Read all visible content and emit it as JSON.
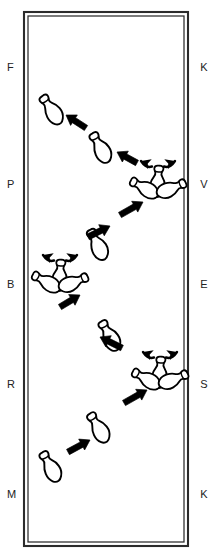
{
  "diagram": {
    "type": "pin-deflection-schematic",
    "frame": {
      "name": "lane-frame",
      "style": "double-line-rectangle",
      "color": "#2b2b2b",
      "x": 24,
      "y": 12,
      "width": 164,
      "height": 534
    },
    "colors": {
      "ink": "#000000",
      "frame": "#2b2b2b",
      "label": "#222222",
      "background": "#ffffff"
    },
    "left_labels": [
      {
        "text": "F",
        "y": 68
      },
      {
        "text": "P",
        "y": 185
      },
      {
        "text": "B",
        "y": 285
      },
      {
        "text": "R",
        "y": 385
      },
      {
        "text": "M",
        "y": 495
      }
    ],
    "right_labels": [
      {
        "text": "K",
        "y": 68
      },
      {
        "text": "V",
        "y": 185
      },
      {
        "text": "E",
        "y": 285
      },
      {
        "text": "S",
        "y": 385
      },
      {
        "text": "K",
        "y": 495
      }
    ],
    "pins": [
      {
        "name": "pin-1",
        "cx": 52,
        "cy": 110,
        "angle": -35,
        "scale": 1.0
      },
      {
        "name": "pin-2",
        "cx": 101,
        "cy": 148,
        "angle": -30,
        "scale": 1.0
      },
      {
        "name": "pin-3",
        "cx": 98,
        "cy": 245,
        "angle": -28,
        "scale": 1.0
      },
      {
        "name": "pin-4",
        "cx": 110,
        "cy": 336,
        "angle": -30,
        "scale": 1.0
      },
      {
        "name": "pin-5",
        "cx": 99,
        "cy": 428,
        "angle": -32,
        "scale": 1.0
      },
      {
        "name": "pin-6",
        "cx": 51,
        "cy": 467,
        "angle": -30,
        "scale": 1.0
      }
    ],
    "clusters": [
      {
        "name": "cluster-1",
        "cx": 158,
        "cy": 178,
        "note": "three-pin spread"
      },
      {
        "name": "cluster-2",
        "cx": 60,
        "cy": 272,
        "note": "three-pin spread"
      },
      {
        "name": "cluster-3",
        "cx": 160,
        "cy": 369,
        "note": "three-pin spread"
      }
    ],
    "arrows": [
      {
        "name": "arrow-1",
        "x1": 86,
        "y1": 128,
        "x2": 66,
        "y2": 115,
        "dir": "up-left"
      },
      {
        "name": "arrow-2",
        "x1": 137,
        "y1": 163,
        "x2": 117,
        "y2": 152,
        "dir": "up-left"
      },
      {
        "name": "arrow-3",
        "x1": 120,
        "y1": 215,
        "x2": 143,
        "y2": 202,
        "dir": "up-right"
      },
      {
        "name": "arrow-4",
        "x1": 88,
        "y1": 237,
        "x2": 110,
        "y2": 226,
        "dir": "up-right"
      },
      {
        "name": "arrow-5",
        "x1": 60,
        "y1": 307,
        "x2": 80,
        "y2": 295,
        "dir": "up-right"
      },
      {
        "name": "arrow-6",
        "x1": 122,
        "y1": 348,
        "x2": 100,
        "y2": 337,
        "dir": "down-left"
      },
      {
        "name": "arrow-7",
        "x1": 124,
        "y1": 403,
        "x2": 147,
        "y2": 390,
        "dir": "up-right"
      },
      {
        "name": "arrow-8",
        "x1": 68,
        "y1": 452,
        "x2": 90,
        "y2": 440,
        "dir": "up-right"
      }
    ],
    "curved_arrows": [
      {
        "name": "curved-arrow-cluster1-left",
        "cluster": "cluster-1",
        "side": "left"
      },
      {
        "name": "curved-arrow-cluster1-right",
        "cluster": "cluster-1",
        "side": "right"
      },
      {
        "name": "curved-arrow-cluster2-left",
        "cluster": "cluster-2",
        "side": "left"
      },
      {
        "name": "curved-arrow-cluster2-right",
        "cluster": "cluster-2",
        "side": "right"
      },
      {
        "name": "curved-arrow-cluster3-left",
        "cluster": "cluster-3",
        "side": "left"
      },
      {
        "name": "curved-arrow-cluster3-right",
        "cluster": "cluster-3",
        "side": "right"
      }
    ]
  }
}
